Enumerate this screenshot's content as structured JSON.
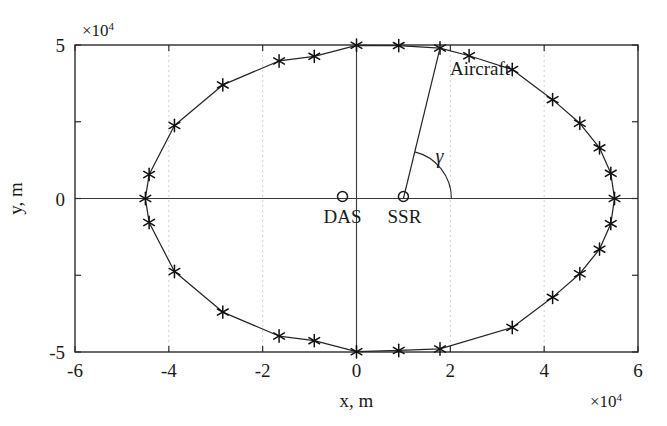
{
  "figure": {
    "background_color": "#ffffff",
    "line_color": "#262626",
    "marker_color": "#111111",
    "grid_color": "#c9c9c9"
  },
  "axes": {
    "x_title": "x, m",
    "y_title": "y, m",
    "x_exponent_prefix": "×",
    "x_exponent_base": "10",
    "x_exponent_power": "4",
    "y_exponent_prefix": "×",
    "y_exponent_base": "10",
    "y_exponent_power": "4",
    "x_ticks": [
      "-6",
      "-4",
      "-2",
      "0",
      "2",
      "4",
      "6"
    ],
    "y_ticks": [
      "5",
      "0",
      "-5"
    ]
  },
  "annotations": {
    "aircraft_label": "Aircraft",
    "das_label": "DAS",
    "ssr_label": "SSR",
    "gamma_label": "γ"
  },
  "chart_data": {
    "type": "scatter",
    "title": "",
    "xlabel": "x, m",
    "ylabel": "y, m",
    "xlim": [
      -60000,
      60000
    ],
    "ylim": [
      -50000,
      50000
    ],
    "x_tick_values": [
      -60000,
      -40000,
      -20000,
      0,
      20000,
      40000,
      60000
    ],
    "y_tick_values": [
      50000,
      0,
      -50000
    ],
    "x_scale_exponent": 4,
    "y_scale_exponent": 4,
    "grid": true,
    "grid_axis": "x",
    "legend": "none",
    "marker_style": "asterisk",
    "marker_count": 24,
    "series": [
      {
        "name": "Aircraft trajectory",
        "closed": true,
        "x": [
          55000,
          54200,
          51800,
          47600,
          41800,
          33200,
          24000,
          17800,
          9000,
          0,
          -9000,
          -16500,
          -28500,
          -38800,
          -44200,
          -45000,
          -44200,
          -38800,
          -28500,
          -16500,
          -9000,
          0,
          9000,
          17800,
          33200,
          41800,
          47600,
          51800,
          54200
        ],
        "y": [
          0,
          8200,
          16500,
          24500,
          32200,
          42000,
          46500,
          49000,
          49800,
          49900,
          46300,
          44800,
          37000,
          23800,
          7800,
          0,
          -7800,
          -23800,
          -37000,
          -44800,
          -46300,
          -49900,
          -49500,
          -49000,
          -42000,
          -32200,
          -24500,
          -16500,
          -8200
        ]
      }
    ],
    "markers": {
      "x": [
        55000,
        54200,
        51800,
        47600,
        41800,
        33200,
        24000,
        17800,
        9000,
        0,
        -9000,
        -16500,
        -28500,
        -38800,
        -44200,
        -45000,
        -44200,
        -38800,
        -28500,
        -16500,
        -9000,
        0,
        9000,
        17800,
        33200,
        41800,
        47600,
        51800,
        54200
      ],
      "y": [
        0,
        8200,
        16500,
        24500,
        32200,
        42000,
        46500,
        49000,
        49800,
        49900,
        46300,
        44800,
        37000,
        23800,
        7800,
        0,
        -7800,
        -23800,
        -37000,
        -44800,
        -46300,
        -49900,
        -49500,
        -49000,
        -42000,
        -32200,
        -24500,
        -16500,
        -8200
      ]
    },
    "annotations": [
      {
        "name": "DAS",
        "x": 0,
        "y": 0,
        "symbol": "open-circle"
      },
      {
        "name": "SSR",
        "x": 10000,
        "y": 0,
        "symbol": "open-circle"
      },
      {
        "name": "Aircraft",
        "x": 17800,
        "y": 49000,
        "symbol": "text"
      },
      {
        "name": "gamma",
        "x": 10000,
        "y": 0,
        "symbol": "angle-arc",
        "note": "angle between SSR-to-aircraft line of sight and positive x axis"
      }
    ],
    "line_of_sight": {
      "from_x": 10000,
      "from_y": 0,
      "to_x": 17800,
      "to_y": 49000
    }
  }
}
